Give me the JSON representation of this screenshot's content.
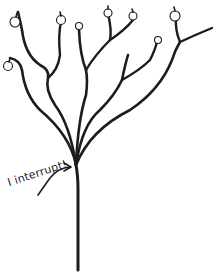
{
  "diagram": {
    "type": "tree-illustration",
    "annotation": {
      "text": "I interrupt!",
      "arrow_target": "trunk-base-of-branches"
    },
    "colors": {
      "ink": "#1c1c1c",
      "background": "#ffffff"
    },
    "apples": [
      {
        "id": "apple-1",
        "x": 15,
        "y": 18
      },
      {
        "id": "apple-2",
        "x": 61,
        "y": 18
      },
      {
        "id": "apple-3",
        "x": 79,
        "y": 25
      },
      {
        "id": "apple-4",
        "x": 108,
        "y": 13
      },
      {
        "id": "apple-5",
        "x": 133,
        "y": 16
      },
      {
        "id": "apple-6",
        "x": 158,
        "y": 40
      },
      {
        "id": "apple-7",
        "x": 175,
        "y": 15
      },
      {
        "id": "apple-8",
        "x": 7,
        "y": 65
      }
    ]
  }
}
